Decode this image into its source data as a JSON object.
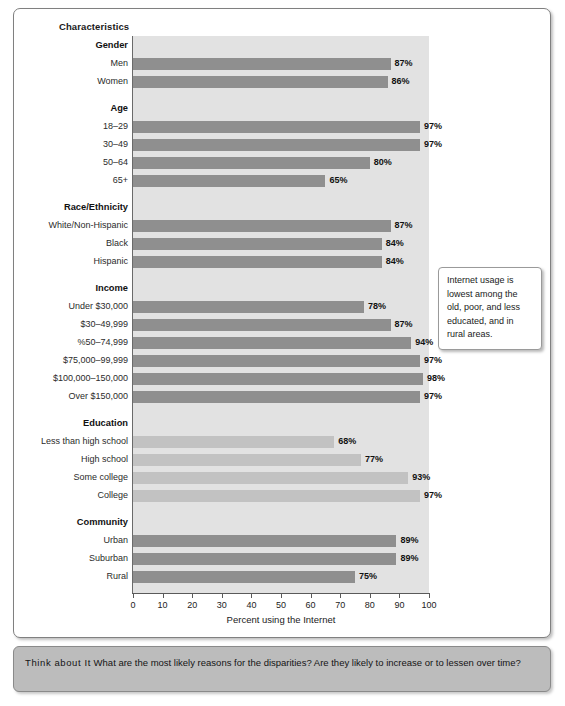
{
  "figure": {
    "column_header": "Characteristics",
    "x_axis_title": "Percent using the Internet",
    "callout_text": "Internet usage is lowest among the old, poor, and less educated, and in rural areas.",
    "think_about_it_label": "Think about It",
    "think_about_it_text": "What are the most likely reasons for the disparities? Are they likely to increase or to lessen over time?",
    "colors": {
      "bar_dark": "#8f8f8f",
      "bar_light": "#c2c2c2",
      "plot_background": "#e2e2e2",
      "band_background": "#bcbcbc"
    }
  },
  "chart_data": {
    "type": "bar",
    "orientation": "horizontal",
    "title": "Characteristics",
    "xlabel": "Percent using the Internet",
    "ylabel": "Characteristics",
    "xlim": [
      0,
      100
    ],
    "xticks": [
      0,
      10,
      20,
      30,
      40,
      50,
      60,
      70,
      80,
      90,
      100
    ],
    "grid": false,
    "legend": false,
    "value_suffix": "%",
    "groups": [
      {
        "name": "Gender",
        "shade": "dark",
        "categories": [
          "Men",
          "Women"
        ],
        "values": [
          87,
          86
        ],
        "labels": [
          "87%",
          "86%"
        ]
      },
      {
        "name": "Age",
        "shade": "dark",
        "categories": [
          "18–29",
          "30–49",
          "50–64",
          "65+"
        ],
        "values": [
          97,
          97,
          80,
          65
        ],
        "labels": [
          "97%",
          "97%",
          "80%",
          "65%"
        ]
      },
      {
        "name": "Race/Ethnicity",
        "shade": "dark",
        "categories": [
          "White/Non-Hispanic",
          "Black",
          "Hispanic"
        ],
        "values": [
          87,
          84,
          84
        ],
        "labels": [
          "87%",
          "84%",
          "84%"
        ]
      },
      {
        "name": "Income",
        "shade": "dark",
        "categories": [
          "Under $30,000",
          "$30–49,999",
          "%50–74,999",
          "$75,000–99,999",
          "$100,000–150,000",
          "Over $150,000"
        ],
        "values": [
          78,
          87,
          94,
          97,
          98,
          97
        ],
        "labels": [
          "78%",
          "87%",
          "94%",
          "97%",
          "98%",
          "97%"
        ]
      },
      {
        "name": "Education",
        "shade": "light",
        "categories": [
          "Less than high school",
          "High school",
          "Some college",
          "College"
        ],
        "values": [
          68,
          77,
          93,
          97
        ],
        "labels": [
          "68%",
          "77%",
          "93%",
          "97%"
        ]
      },
      {
        "name": "Community",
        "shade": "dark",
        "categories": [
          "Urban",
          "Suburban",
          "Rural"
        ],
        "values": [
          89,
          89,
          75
        ],
        "labels": [
          "89%",
          "89%",
          "75%"
        ]
      }
    ]
  }
}
